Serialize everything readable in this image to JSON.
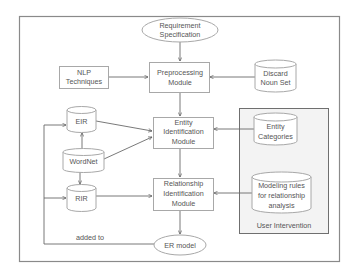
{
  "diagram": {
    "type": "flowchart",
    "colors": {
      "frame": "#8a8a8a",
      "shape_stroke": "#a8a8a8",
      "text": "#555555",
      "user_intervention_fill": "#f3f3f3",
      "connector": "#6a6a6a"
    },
    "nodes": {
      "requirement_spec": {
        "shape": "ellipse",
        "lines": [
          "Requirement",
          "Specification"
        ]
      },
      "preprocessing": {
        "shape": "rectangle",
        "lines": [
          "Preprocessing",
          "Module"
        ]
      },
      "nlp": {
        "shape": "rectangle",
        "lines": [
          "NLP",
          "Techniques"
        ]
      },
      "discard_noun": {
        "shape": "cylinder",
        "lines": [
          "Discard",
          "Noun Set"
        ]
      },
      "eir": {
        "shape": "cylinder",
        "lines": [
          "EIR"
        ]
      },
      "wordnet": {
        "shape": "cylinder",
        "lines": [
          "WordNet"
        ]
      },
      "rir": {
        "shape": "cylinder",
        "lines": [
          "RIR"
        ]
      },
      "entity_id": {
        "shape": "rectangle",
        "lines": [
          "Entity",
          "Identification",
          "Module"
        ]
      },
      "relationship_id": {
        "shape": "rectangle",
        "lines": [
          "Relationship",
          "Identification",
          "Module"
        ]
      },
      "entity_categories": {
        "shape": "cylinder",
        "lines": [
          "Entity",
          "Categories"
        ]
      },
      "modeling_rules": {
        "shape": "cylinder",
        "lines": [
          "Modeling rules",
          "for relationship",
          "analysis"
        ]
      },
      "er_model": {
        "shape": "ellipse",
        "lines": [
          "ER model"
        ]
      }
    },
    "groups": {
      "user_intervention": {
        "label": "User Intervention",
        "contains": [
          "entity_categories",
          "modeling_rules"
        ]
      }
    },
    "edges": [
      {
        "from": "requirement_spec",
        "to": "preprocessing"
      },
      {
        "from": "nlp",
        "to": "preprocessing"
      },
      {
        "from": "discard_noun",
        "to": "preprocessing"
      },
      {
        "from": "preprocessing",
        "to": "entity_id"
      },
      {
        "from": "eir",
        "to": "entity_id"
      },
      {
        "from": "wordnet",
        "to": "entity_id"
      },
      {
        "from": "wordnet",
        "to": "eir"
      },
      {
        "from": "wordnet",
        "to": "rir"
      },
      {
        "from": "entity_categories",
        "to": "entity_id"
      },
      {
        "from": "entity_id",
        "to": "relationship_id"
      },
      {
        "from": "rir",
        "to": "relationship_id"
      },
      {
        "from": "modeling_rules",
        "to": "relationship_id"
      },
      {
        "from": "relationship_id",
        "to": "er_model"
      },
      {
        "from": "er_model",
        "to": "eir",
        "label": "added to"
      },
      {
        "from": "er_model",
        "to": "rir",
        "label": "added to"
      }
    ],
    "edge_labels": {
      "added_to": "added to"
    }
  }
}
